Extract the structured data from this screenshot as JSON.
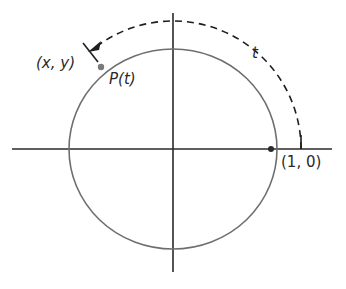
{
  "diagram": {
    "type": "unit-circle-arc-length",
    "labels": {
      "point_coords": "(x, y)",
      "point_name": "P(t)",
      "arc_length": "t",
      "start_point": "(1, 0)"
    },
    "colors": {
      "axes": "#2a2a2a",
      "circle": "#6e6e6e",
      "dashed_arc": "#1e1e1e",
      "point": "#7a7a7a"
    },
    "geometry": {
      "origin": [
        173,
        149
      ],
      "circle_radius_x": 104,
      "circle_radius_y": 100,
      "arc_radius": 128
    }
  }
}
